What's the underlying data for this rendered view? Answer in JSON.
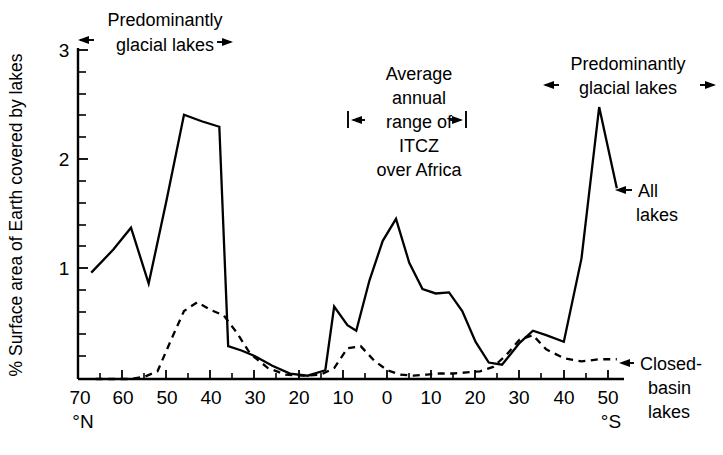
{
  "chart_data": {
    "type": "line",
    "title": "",
    "xlabel": "Latitude",
    "ylabel": "% Surface area of Earth covered by lakes",
    "xlim": [
      70,
      -55
    ],
    "ylim": [
      0,
      3
    ],
    "grid": false,
    "legend_position": "inline-annotations",
    "x_tick_labels": [
      "70",
      "60",
      "50",
      "40",
      "30",
      "20",
      "10",
      "0",
      "10",
      "20",
      "30",
      "40",
      "50"
    ],
    "x_tick_values": [
      70,
      60,
      50,
      40,
      30,
      20,
      10,
      0,
      -10,
      -20,
      -30,
      -40,
      -50
    ],
    "x_minor_tick_step": 5,
    "y_tick_labels": [
      "1",
      "2",
      "3"
    ],
    "y_tick_values": [
      1,
      2,
      3
    ],
    "y_minor_tick_step": 0.2,
    "hemisphere_left_label": "°N",
    "hemisphere_right_label": "°S",
    "series": [
      {
        "name": "All lakes",
        "style": "solid",
        "x": [
          67,
          62,
          58,
          54,
          50,
          46,
          42,
          38,
          36,
          33,
          30,
          26,
          22,
          18,
          14,
          12,
          9,
          7,
          4,
          1,
          -2,
          -5,
          -8,
          -11,
          -14,
          -17,
          -20,
          -23,
          -26,
          -30,
          -33,
          -36,
          -40,
          -44,
          -48,
          -52
        ],
        "y": [
          0.97,
          1.18,
          1.38,
          0.87,
          1.62,
          2.41,
          2.35,
          2.3,
          0.3,
          0.26,
          0.21,
          0.12,
          0.05,
          0.03,
          0.08,
          0.66,
          0.49,
          0.44,
          0.9,
          1.26,
          1.46,
          1.06,
          0.82,
          0.78,
          0.79,
          0.62,
          0.34,
          0.15,
          0.13,
          0.33,
          0.44,
          0.4,
          0.34,
          1.1,
          2.48,
          1.74
        ]
      },
      {
        "name": "Closed-basin lakes",
        "style": "dashed",
        "x": [
          66,
          62,
          58,
          55,
          52,
          49,
          46,
          43,
          40,
          37,
          34,
          31,
          27,
          23,
          19,
          15,
          12,
          9,
          6,
          3,
          0,
          -3,
          -6,
          -9,
          -12,
          -15,
          -18,
          -21,
          -24,
          -27,
          -30,
          -33,
          -36,
          -40,
          -44,
          -48,
          -52
        ],
        "y": [
          0.0,
          0.0,
          0.0,
          0.02,
          0.07,
          0.35,
          0.62,
          0.7,
          0.63,
          0.58,
          0.42,
          0.23,
          0.1,
          0.04,
          0.03,
          0.04,
          0.1,
          0.28,
          0.3,
          0.17,
          0.08,
          0.04,
          0.03,
          0.04,
          0.05,
          0.05,
          0.06,
          0.07,
          0.11,
          0.22,
          0.36,
          0.4,
          0.27,
          0.19,
          0.16,
          0.18,
          0.18
        ]
      }
    ],
    "annotations": [
      {
        "id": "glacial-north",
        "text_lines": [
          "Predominantly",
          "glacial lakes"
        ],
        "type": "double-arrow-span",
        "x_range": [
          70,
          41
        ]
      },
      {
        "id": "itcz",
        "text_lines": [
          "Average",
          "annual",
          "range of",
          "ITCZ",
          "over Africa"
        ],
        "type": "double-arrow-span-barred",
        "x_range": [
          11,
          -16
        ]
      },
      {
        "id": "glacial-south",
        "text_lines": [
          "Predominantly",
          "glacial lakes"
        ],
        "type": "double-arrow-span",
        "x_range": [
          -36,
          -55
        ]
      },
      {
        "id": "all-lakes-callout",
        "text_lines": [
          "All",
          "lakes"
        ],
        "type": "left-arrow-callout"
      },
      {
        "id": "closed-basin-callout",
        "text_lines": [
          "Closed-",
          "basin",
          "lakes"
        ],
        "type": "left-arrow-callout"
      }
    ]
  },
  "axis": {
    "ylabel": "% Surface area of Earth covered by lakes",
    "y_ticks": [
      {
        "label": "3"
      },
      {
        "label": "2"
      },
      {
        "label": "1"
      }
    ],
    "x_ticks": [
      {
        "label": "70"
      },
      {
        "label": "60"
      },
      {
        "label": "50"
      },
      {
        "label": "40"
      },
      {
        "label": "30"
      },
      {
        "label": "20"
      },
      {
        "label": "10"
      },
      {
        "label": "0"
      },
      {
        "label": "10"
      },
      {
        "label": "20"
      },
      {
        "label": "30"
      },
      {
        "label": "40"
      },
      {
        "label": "50"
      }
    ],
    "north_label": "°N",
    "south_label": "°S"
  },
  "annotations": {
    "glacial_north": {
      "line1": "Predominantly",
      "line2": "glacial lakes"
    },
    "itcz": {
      "line1": "Average",
      "line2": "annual",
      "line3": "range of",
      "line4": "ITCZ",
      "line5": "over Africa"
    },
    "glacial_south": {
      "line1": "Predominantly",
      "line2": "glacial lakes"
    },
    "all_lakes": {
      "line1": "All",
      "line2": "lakes"
    },
    "closed_basin": {
      "line1": "Closed-",
      "line2": "basin",
      "line3": "lakes"
    }
  },
  "colors": {
    "ink": "#000000",
    "background": "#ffffff"
  }
}
